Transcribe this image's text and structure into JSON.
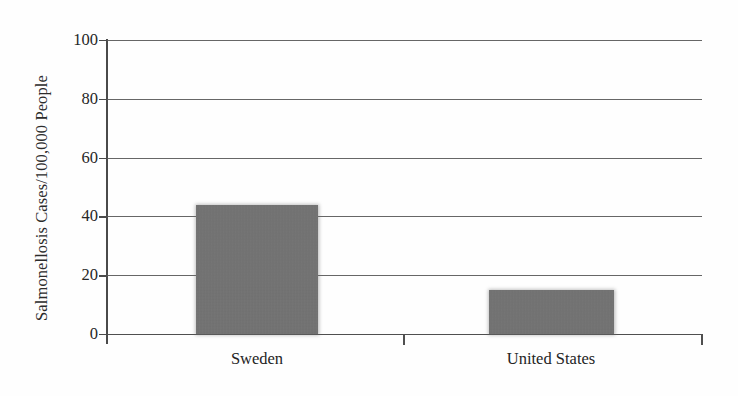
{
  "chart_data": {
    "type": "bar",
    "title": "",
    "subtitle": "",
    "xlabel": "",
    "ylabel": "Salmonellosis Cases/100,000 People",
    "categories": [
      "Sweden",
      "United States"
    ],
    "values": [
      44,
      15
    ],
    "series": [
      {
        "name": "Salmonellosis incidence",
        "values": [
          44,
          15
        ]
      }
    ],
    "ylim": [
      0,
      100
    ],
    "ytick_labels": [
      "0",
      "20",
      "40",
      "60",
      "80",
      "100"
    ],
    "ytick_values": [
      0,
      20,
      40,
      60,
      80,
      100
    ],
    "grid": true,
    "grid_axis": "y",
    "legend": false,
    "legend_position": "none",
    "annotations": [],
    "bar_color": "#737373",
    "axis_color": "#4a4a4a",
    "grid_color": "#595959",
    "background_color": "#fefefe",
    "text_color": "#262626"
  },
  "axis": {
    "y_title": "Salmonellosis Cases/100,000 People"
  }
}
